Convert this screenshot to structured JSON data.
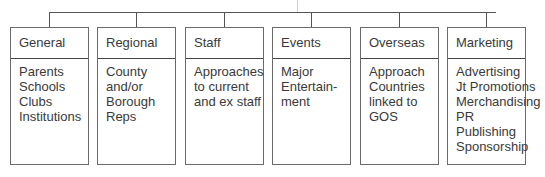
{
  "diagram": {
    "type": "org-tree",
    "line_color": "#555555",
    "box_border_color": "#6a6a6a",
    "text_color": "#3a3a3a",
    "categories": [
      {
        "title": "General",
        "items": [
          "Parents",
          "Schools",
          "Clubs",
          "Institutions"
        ]
      },
      {
        "title": "Regional",
        "items": [
          "County",
          "and/or",
          "Borough",
          "Reps"
        ]
      },
      {
        "title": "Staff",
        "items": [
          "Approaches",
          "to current",
          "and ex staff"
        ]
      },
      {
        "title": "Events",
        "items": [
          "Major",
          "Entertain-",
          "ment"
        ]
      },
      {
        "title": "Overseas",
        "items": [
          "Approach",
          "Countries",
          "linked to",
          "GOS"
        ]
      },
      {
        "title": "Marketing",
        "items": [
          "Advertising",
          "Jt Promotions",
          "Merchandising",
          "PR",
          "Publishing",
          "Sponsorship"
        ]
      }
    ]
  }
}
